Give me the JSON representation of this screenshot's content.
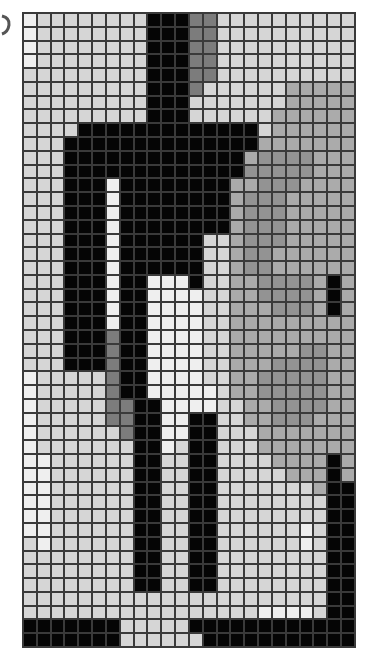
{
  "grid": {
    "columns": 24,
    "rows": 46,
    "palette": {
      "K": "#050505",
      "D": "#7c7c7c",
      "M": "#939393",
      "G": "#ababab",
      "L": "#d6d6d6",
      "W": "#efefef"
    },
    "cells": [
      "WLLLLLLLLKKKDDLLLLLLLLLL",
      "WLLLLLLLLKKKDDLLLLLLLLLL",
      "WLLLLLLLLKKKDDLLLLLLLLLL",
      "WLLLLLLLLKKKDDLLLLLLLLLL",
      "LLLLLLLLLKKKDDLLLLLLLLLL",
      "LLLLLLLLLKKKDLLLLLLGGGGG",
      "LLLLLLLLLKKKLLLLLLLGGGGG",
      "LLLLLLLLLKKKLLLLLLGGGGGG",
      "LLLLKKKKKKKKKKKKKLGGGGGG",
      "LLLKKKKKKKKKKKKKKGGGGGGG",
      "LLLKKKKKKKKKKKKKGMMMMGGG",
      "LLLKKKKKKKKKKKKKMMMMMGGG",
      "LLLKKKWKKKKKKKKGGMMMGGGG",
      "LLLKKKWKKKKKKKKGMMMGGGGG",
      "LLLKKKWKKKKKKKKGMMMGGGGG",
      "LLLKKKWKKKKKKKKGMMMGGGGG",
      "LLLKKKWKKKKKKLLGMMMGGGGG",
      "LLLKKKWKKKKKKLLGMMGGGGGG",
      "LLLKKKWKKKKKKLLGMMGGGGGG",
      "LLLKKKWKKWWWKLLGGMMMMGKG",
      "LLLKKKWKKWWWWLLGGMMMMGKG",
      "LLLKKKWKKWWWWLLGGGMMMGKG",
      "LLLKKKWKKWWWWLLGGGGGGGGG",
      "LLLKKKDKKWWWWLLGGGGGGGGG",
      "LLLKKKDKKWWWWLLGGGGGMMGG",
      "LLLKKKDKKWWWWLLGGGMMMMGG",
      "WLLLLLDKKWWWWLLGGMMMMMGG",
      "WLLLLLDKKWWWWWLGGMMMMMGG",
      "WLLLLLDDKKWWWWLLGGMMMMGG",
      "WLLLLLDDKKWWKKLLGGMMMGGG",
      "WLLLLLLDKKWWKKLLLGGGGGGG",
      "WLLLLLLLKKWLKKLLLGGGGGGG",
      "WWLLLLLLKKLLKKLLLLGGGGKG",
      "WWLLLLLLKKLLKKLLLLLGGGKG",
      "WWLLLLLLKKLLKKLLLLLLLGKK",
      "WWLLLLLLKKLLKKLLLLLLLLKK",
      "WWLLLLLLKKLLKKLLLLLLLLKK",
      "WWLLLLLLKKLLKKLLLLLLWLKK",
      "LWLLLLLLKKLLKKLLLLLLWLKK",
      "LLLLLLLLKKLLKKLLLLLLLLKK",
      "LLLLLLLLKKLLKKLLLLLLLLKK",
      "LLLLLLLLKKLLKKLLLLLLLLKK",
      "LLLLLLLLLLLLLLLLLLLLLLKK",
      "LLLLLLLLLLLLLLLLLWWWWLKK",
      "KKKKKKKLLLLLKKKKKKKKKKKK",
      "KKKKKKKLLLLLLKKKKKKKKKKK"
    ]
  }
}
